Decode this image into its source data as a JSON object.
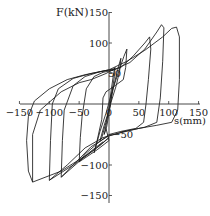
{
  "chart_data": {
    "type": "line",
    "title": "",
    "xlabel": "s(mm)",
    "ylabel": "F(kN)",
    "xlim": [
      -150,
      150
    ],
    "ylim": [
      -150,
      150
    ],
    "grid": false,
    "legend": null,
    "x_ticks": [
      -150,
      -100,
      -50,
      0,
      50,
      100,
      150
    ],
    "y_ticks": [
      -150,
      -100,
      -50,
      50,
      100,
      150
    ],
    "x_tick_labels": [
      "-150",
      "-100",
      "-50",
      "0",
      "50",
      "100",
      "150"
    ],
    "y_tick_labels": [
      "-150",
      "-100",
      "-50",
      "50",
      "100",
      "150"
    ],
    "series": [
      {
        "name": "cycle ±10mm",
        "amplitude_mm": 10,
        "peak_pos_kN": 60,
        "peak_neg_kN": -55
      },
      {
        "name": "cycle ±20mm",
        "amplitude_mm": 20,
        "peak_pos_kN": 75,
        "peak_neg_kN": -70
      },
      {
        "name": "cycle ±30mm",
        "amplitude_mm": 30,
        "peak_pos_kN": 90,
        "peak_neg_kN": -90
      },
      {
        "name": "cycle ±50/70mm",
        "amplitude_pos_mm": 70,
        "amplitude_neg_mm": -50,
        "peak_pos_kN": 110,
        "peak_neg_kN": -95
      },
      {
        "name": "cycle ±90/75mm",
        "amplitude_pos_mm": 90,
        "amplitude_neg_mm": -80,
        "peak_pos_kN": 130,
        "peak_neg_kN": -120
      },
      {
        "name": "cycle ±115/100mm",
        "amplitude_pos_mm": 115,
        "amplitude_neg_mm": -100,
        "peak_pos_kN": 126,
        "peak_neg_kN": -125
      },
      {
        "name": "cycle -130mm",
        "amplitude_neg_mm": -130,
        "peak_neg_kN": -128
      }
    ]
  },
  "axes": {
    "x_label": "s(mm)",
    "y_label": "F(kN)",
    "x_ticks": [
      "-150",
      "-100",
      "-50",
      "0",
      "50",
      "100",
      "150"
    ],
    "y_ticks": [
      "150",
      "100",
      "50",
      "-50",
      "-100",
      "-150"
    ]
  }
}
